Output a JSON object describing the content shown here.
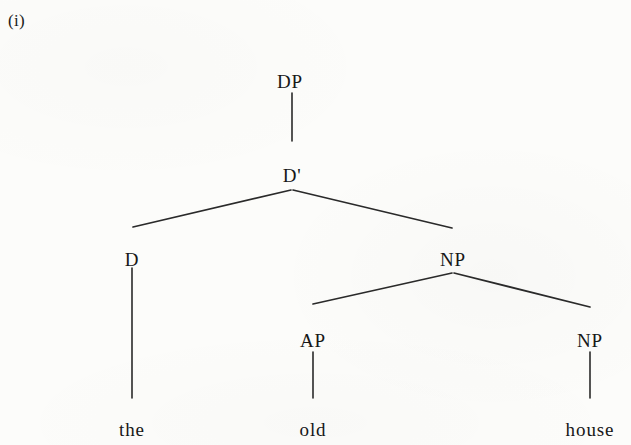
{
  "example": {
    "number_label": "(i)"
  },
  "colors": {
    "page_background": "#fcfcfa",
    "ink": "#1a1a1a",
    "branch_line": "#2a2a2a"
  },
  "tree": {
    "type": "syntax-tree",
    "description": "X-bar DP structure for the phrase 'the old house'",
    "sentence": "the old house",
    "nodes": [
      {
        "id": "DP",
        "label": "DP",
        "x": 290,
        "y": 72,
        "level": 0
      },
      {
        "id": "Dbar",
        "label": "D'",
        "x": 292,
        "y": 166,
        "level": 1
      },
      {
        "id": "D",
        "label": "D",
        "x": 132,
        "y": 250,
        "level": 2
      },
      {
        "id": "NP1",
        "label": "NP",
        "x": 453,
        "y": 250,
        "level": 2
      },
      {
        "id": "AP",
        "label": "AP",
        "x": 313,
        "y": 331,
        "level": 3
      },
      {
        "id": "NP2",
        "label": "NP",
        "x": 590,
        "y": 331,
        "level": 3
      }
    ],
    "terminals": [
      {
        "id": "the",
        "label": "the",
        "x": 132,
        "y": 420,
        "parent": "D"
      },
      {
        "id": "old",
        "label": "old",
        "x": 313,
        "y": 420,
        "parent": "AP"
      },
      {
        "id": "house",
        "label": "house",
        "x": 590,
        "y": 420,
        "parent": "NP2"
      }
    ],
    "edges": [
      {
        "from": "DP",
        "to": "Dbar",
        "kind": "stem",
        "x1": 292,
        "y1": 93,
        "x2": 292,
        "y2": 141
      },
      {
        "from": "Dbar",
        "to": "D",
        "kind": "branch",
        "x1": 291,
        "y1": 190,
        "x2": 133,
        "y2": 227
      },
      {
        "from": "Dbar",
        "to": "NP1",
        "kind": "branch",
        "x1": 293,
        "y1": 190,
        "x2": 452,
        "y2": 228
      },
      {
        "from": "NP1",
        "to": "AP",
        "kind": "branch",
        "x1": 452,
        "y1": 273,
        "x2": 313,
        "y2": 304
      },
      {
        "from": "NP1",
        "to": "NP2",
        "kind": "branch",
        "x1": 454,
        "y1": 273,
        "x2": 590,
        "y2": 307
      },
      {
        "from": "D",
        "to": "the",
        "kind": "stem",
        "x1": 132,
        "y1": 268,
        "x2": 132,
        "y2": 398
      },
      {
        "from": "AP",
        "to": "old",
        "kind": "stem",
        "x1": 313,
        "y1": 352,
        "x2": 313,
        "y2": 398
      },
      {
        "from": "NP2",
        "to": "house",
        "kind": "stem",
        "x1": 590,
        "y1": 352,
        "x2": 590,
        "y2": 398
      }
    ]
  }
}
